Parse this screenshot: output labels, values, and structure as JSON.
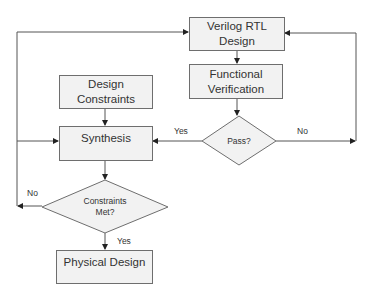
{
  "nodes": {
    "verilog": {
      "line1": "Verilog RTL",
      "line2": "Design"
    },
    "verification": {
      "line1": "Functional",
      "line2": "Verification"
    },
    "pass": {
      "label": "Pass?"
    },
    "constraints": {
      "line1": "Design",
      "line2": "Constraints"
    },
    "synthesis": {
      "label": "Synthesis"
    },
    "met": {
      "line1": "Constraints",
      "line2": "Met?"
    },
    "physical": {
      "label": "Physical Design"
    }
  },
  "edges": {
    "pass_yes": "Yes",
    "pass_no": "No",
    "met_no": "No",
    "met_yes": "Yes"
  },
  "colors": {
    "fill": "#f2f2f2",
    "stroke": "#6e6e6e",
    "line": "#444444"
  }
}
